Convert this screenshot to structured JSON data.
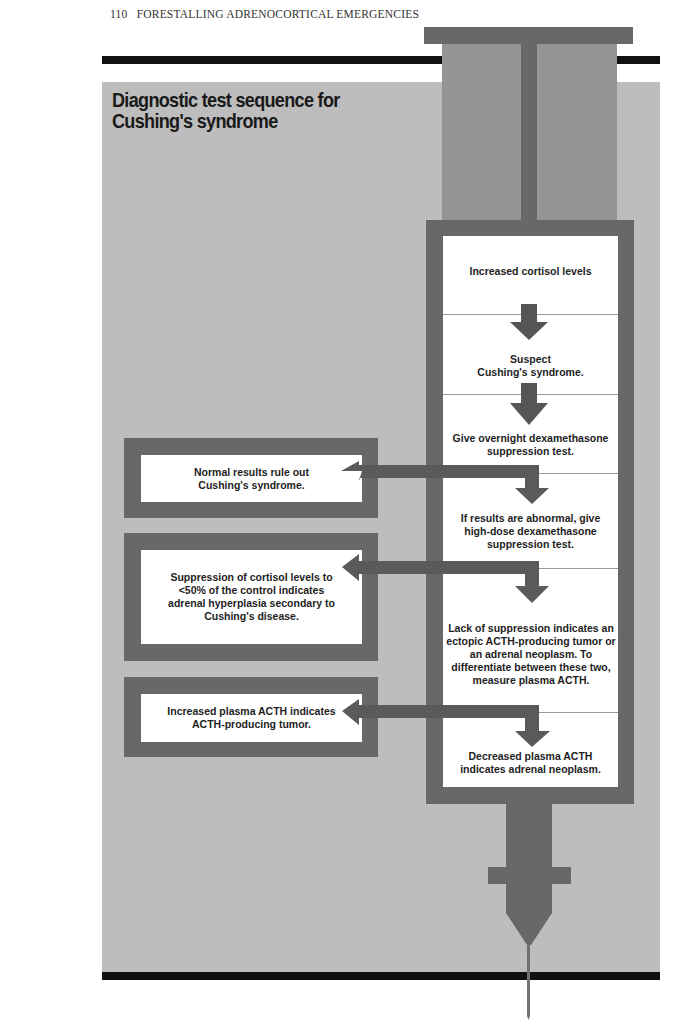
{
  "header": {
    "page_number": "110",
    "running_title": "FORESTALLING ADRENOCORTICAL EMERGENCIES"
  },
  "figure": {
    "title_line1": "Diagnostic test sequence for",
    "title_line2": "Cushing's syndrome",
    "colors": {
      "background_panel": "#bdbdbd",
      "syringe_dark": "#686868",
      "syringe_plunger": "#959595",
      "box_fill": "#ffffff",
      "rule": "#111111"
    },
    "main_steps": [
      "Increased cortisol levels",
      "Suspect\nCushing's syndrome.",
      "Give overnight dexamethasone suppression test.",
      "If results are abnormal, give high-dose dexamethasone suppression test.",
      "Lack of suppression indicates an ectopic ACTH-producing tumor or an adrenal neoplasm. To differentiate between these two, measure plasma ACTH.",
      "Decreased plasma ACTH indicates adrenal neoplasm."
    ],
    "side_outcomes": [
      "Normal results rule out Cushing's syndrome.",
      "Suppression of cortisol levels to <50% of the control indicates adrenal hyperplasia secondary to Cushing's disease.",
      "Increased plasma ACTH indicates ACTH-producing tumor."
    ]
  }
}
